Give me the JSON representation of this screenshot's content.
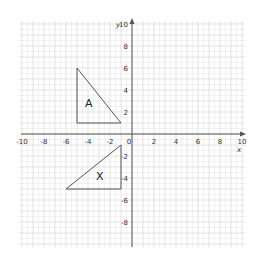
{
  "diagram": {
    "type": "coordinate-plane",
    "x_axis": {
      "label": "x",
      "min": -10,
      "max": 10,
      "tick_labels": [
        "-10",
        "-8",
        "-6",
        "-4",
        "-2",
        "0",
        "2",
        "4",
        "6",
        "8",
        "10"
      ]
    },
    "y_axis": {
      "label": "y",
      "min": -10,
      "max": 10,
      "tick_labels": [
        "10",
        "8",
        "6",
        "4",
        "2",
        "-2",
        "-4",
        "-6",
        "-8"
      ]
    },
    "grid": {
      "major_step": 1,
      "minor_step": 0.5,
      "color": "#e3e3e3",
      "minor_color": "#f1f1f1"
    },
    "axis_color": "#555555",
    "shapes": [
      {
        "name": "A",
        "label": "A",
        "vertices": [
          [
            -5,
            6
          ],
          [
            -5,
            1
          ],
          [
            -1,
            1
          ]
        ],
        "stroke": "#555555"
      },
      {
        "name": "X",
        "label": "X",
        "vertices": [
          [
            -1,
            -1
          ],
          [
            -1,
            -5
          ],
          [
            -6,
            -5
          ]
        ],
        "stroke": "#555555"
      }
    ]
  }
}
